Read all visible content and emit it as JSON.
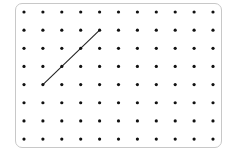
{
  "geoboard": {
    "columns": 11,
    "rows": 8,
    "origin_x": 24,
    "origin_y": 12,
    "spacing_x": 18.9,
    "spacing_y": 18.15,
    "dot_radius": 1.6,
    "dot_color": "#111111",
    "border_color": "#c8c8c8"
  },
  "segments": [
    {
      "from": {
        "col": 1,
        "row": 4
      },
      "to": {
        "col": 4,
        "row": 1
      },
      "color": "#222222",
      "width": 1.1
    }
  ]
}
